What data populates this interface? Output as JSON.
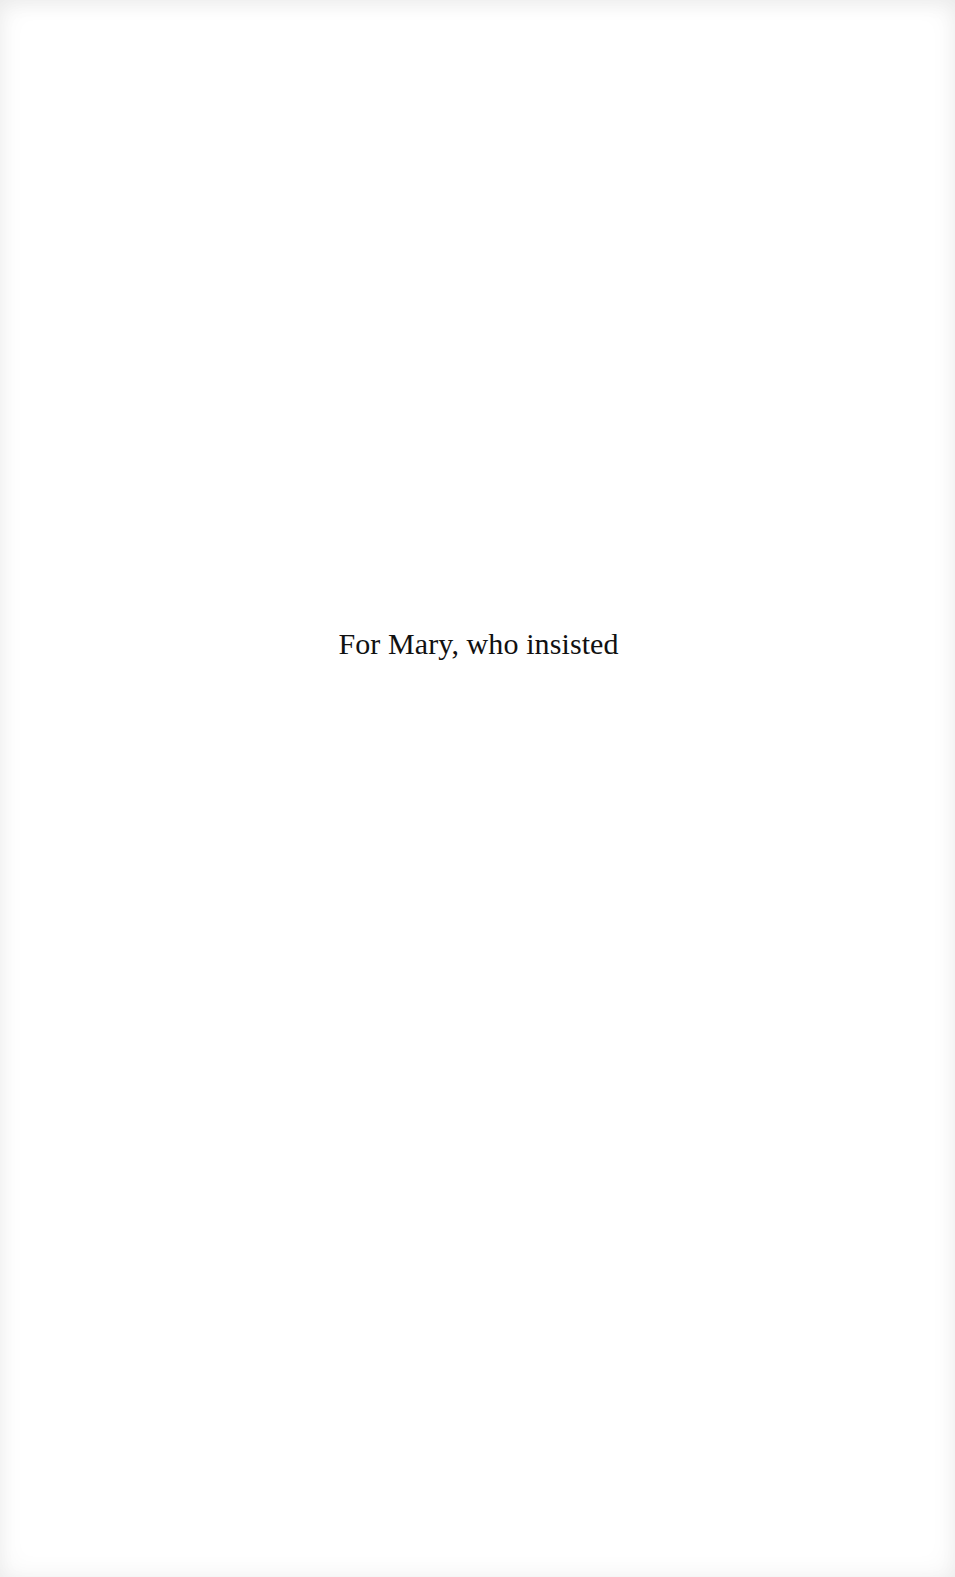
{
  "page": {
    "type": "dedication",
    "dedication_text": "For Mary, who insisted"
  },
  "colors": {
    "background": "#ffffff",
    "text": "#111111"
  }
}
